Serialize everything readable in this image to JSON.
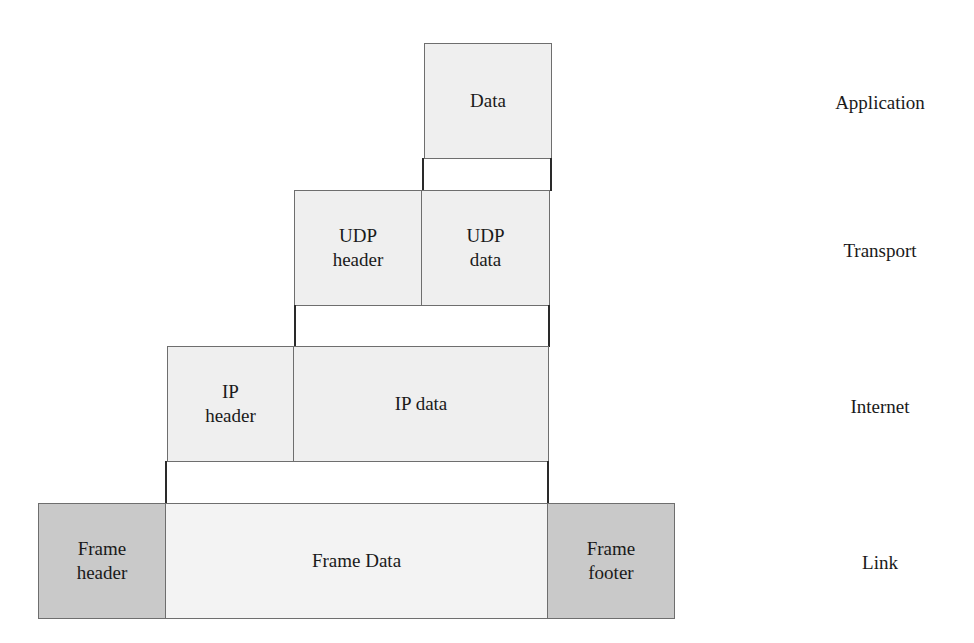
{
  "diagram": {
    "application": {
      "data": "Data"
    },
    "transport": {
      "header": "UDP header",
      "header_l1": "UDP",
      "header_l2": "header",
      "data_l1": "UDP",
      "data_l2": "data"
    },
    "internet": {
      "header_l1": "IP",
      "header_l2": "header",
      "data": "IP data"
    },
    "link": {
      "header_l1": "Frame",
      "header_l2": "header",
      "data": "Frame Data",
      "footer_l1": "Frame",
      "footer_l2": "footer"
    }
  },
  "layers": [
    "Application",
    "Transport",
    "Internet",
    "Link"
  ],
  "colors": {
    "light_fill": "#efefef",
    "dark_fill": "#c9c9c9",
    "border": "#6e6e6e"
  }
}
